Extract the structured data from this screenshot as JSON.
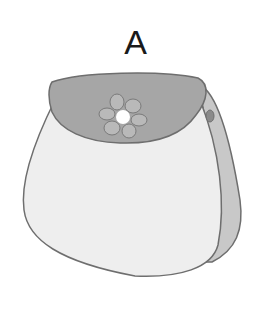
{
  "figure": {
    "label": "A",
    "colors": {
      "body": "#eeeeee",
      "flap": "#a6a6a6",
      "side_panel": "#c8c8c8",
      "outline": "#6e6e6e",
      "flower_petal": "#b9b9b9",
      "flower_center": "#ffffff"
    }
  }
}
